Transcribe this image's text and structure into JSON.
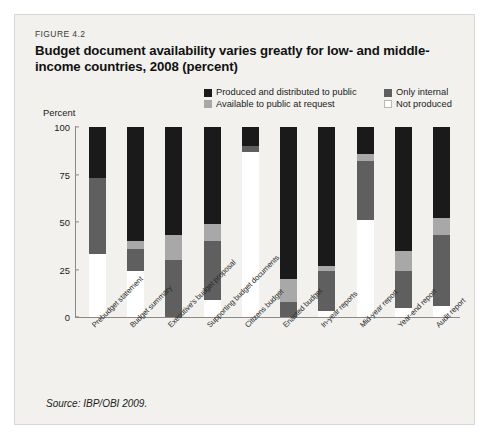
{
  "figure": {
    "label": "FIGURE 4.2",
    "title": "Budget document availability varies greatly for low- and middle-income countries, 2008 (percent)",
    "source": "Source: IBP/OBI 2009."
  },
  "colors": {
    "produced_public": "#1a1a1a",
    "only_internal": "#5f5f5f",
    "available_on_request": "#a8a8a8",
    "not_produced": "#ffffff",
    "panel_bg": "#f2f1ee",
    "axis": "#8b8984"
  },
  "legend": {
    "items": [
      {
        "label": "Produced and distributed to public",
        "color": "#1a1a1a",
        "key": "produced_public"
      },
      {
        "label": "Only internal",
        "color": "#5f5f5f",
        "key": "only_internal"
      },
      {
        "label": "Available to public at request",
        "color": "#a8a8a8",
        "key": "available_on_request"
      },
      {
        "label": "Not produced",
        "color": "#ffffff",
        "key": "not_produced"
      }
    ]
  },
  "chart_data": {
    "type": "bar",
    "stacked": true,
    "title": "Budget document availability varies greatly for low- and middle-income countries, 2008 (percent)",
    "xlabel": "",
    "ylabel": "Percent",
    "ylim": [
      0,
      100
    ],
    "yticks": [
      0,
      25,
      50,
      75,
      100
    ],
    "yticklabels": [
      "0",
      "25",
      "50",
      "75",
      "100"
    ],
    "grid": false,
    "legend_position": "top-right",
    "categories": [
      "Prebudget statement",
      "Budget summary",
      "Executive's budget proposal",
      "Supporting budget documents",
      "Citizens budget",
      "Enacted budget",
      "In-year reports",
      "Mid-year report",
      "Year-end report",
      "Audit report"
    ],
    "series": [
      {
        "name": "Not produced",
        "color": "#ffffff",
        "values": [
          33,
          24,
          0,
          9,
          87,
          0,
          3,
          51,
          5,
          6
        ]
      },
      {
        "name": "Only internal",
        "color": "#5f5f5f",
        "values": [
          40,
          12,
          30,
          31,
          3,
          8,
          21,
          31,
          19,
          37
        ]
      },
      {
        "name": "Available to public at request",
        "color": "#a8a8a8",
        "values": [
          0,
          4,
          13,
          9,
          0,
          12,
          3,
          4,
          11,
          9
        ]
      },
      {
        "name": "Produced and distributed to public",
        "color": "#1a1a1a",
        "values": [
          27,
          60,
          57,
          51,
          10,
          80,
          73,
          14,
          65,
          48
        ]
      }
    ]
  }
}
